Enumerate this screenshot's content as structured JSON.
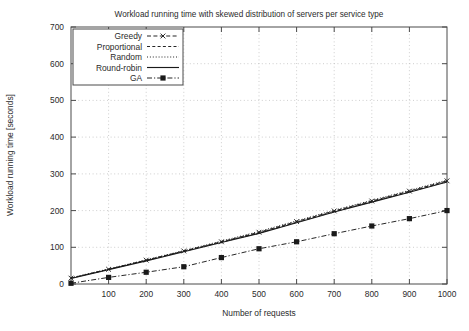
{
  "chart_data": {
    "type": "line",
    "title": "Workload running time with skewed distribution of servers per service type",
    "xlabel": "Number of requests",
    "ylabel": "Workload running time [seconds]",
    "xlim": [
      0,
      1000
    ],
    "ylim": [
      0,
      700
    ],
    "xticks": [
      100,
      200,
      300,
      400,
      500,
      600,
      700,
      800,
      900,
      1000
    ],
    "yticks": [
      0,
      100,
      200,
      300,
      400,
      500,
      600,
      700
    ],
    "grid": true,
    "legend_position": "top-left",
    "x": [
      0,
      100,
      200,
      300,
      400,
      500,
      600,
      700,
      800,
      900,
      1000
    ],
    "series": [
      {
        "name": "Greedy",
        "style": "dashed-with-x-markers",
        "marker": "x",
        "values": [
          16,
          40,
          65,
          90,
          115,
          141,
          170,
          199,
          226,
          253,
          281
        ]
      },
      {
        "name": "Proportional",
        "style": "dashed",
        "marker": "none",
        "values": [
          16,
          40,
          64,
          89,
          114,
          139,
          168,
          197,
          224,
          251,
          279
        ]
      },
      {
        "name": "Random",
        "style": "dotted",
        "marker": "none",
        "values": [
          17,
          41,
          66,
          91,
          117,
          143,
          172,
          201,
          228,
          255,
          283
        ]
      },
      {
        "name": "Round-robin",
        "style": "solid",
        "marker": "none",
        "values": [
          15,
          39,
          63,
          88,
          113,
          138,
          167,
          196,
          223,
          250,
          278
        ]
      },
      {
        "name": "GA",
        "style": "dash-dot-with-square-markers",
        "marker": "square",
        "values": [
          2,
          18,
          32,
          47,
          72,
          96,
          115,
          137,
          158,
          178,
          200
        ]
      }
    ]
  },
  "legend": {
    "items": [
      {
        "label": "Greedy"
      },
      {
        "label": "Proportional"
      },
      {
        "label": "Random"
      },
      {
        "label": "Round-robin"
      },
      {
        "label": "GA"
      }
    ]
  },
  "axes": {
    "y_tick_labels": [
      "700",
      "600",
      "500",
      "400",
      "300",
      "200",
      "100",
      "0"
    ],
    "x_tick_labels": [
      "100",
      "200",
      "300",
      "400",
      "500",
      "600",
      "700",
      "800",
      "900",
      "1000"
    ]
  }
}
